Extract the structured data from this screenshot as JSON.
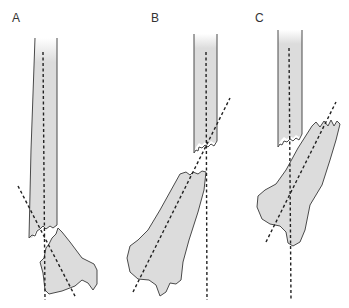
{
  "figure": {
    "panels": [
      {
        "label": "A",
        "description": "Distal radius fracture with transverse break; distal fragment nearly aligned"
      },
      {
        "label": "B",
        "description": "Distal fragment displaced and angulated relative to shaft"
      },
      {
        "label": "C",
        "description": "Distal fragment shortened and overlapping proximal shaft"
      }
    ],
    "colors": {
      "bone_fill": "#dcdcdc",
      "outline": "#4a4a4a",
      "axis_lines": "#222222",
      "background": "#ffffff"
    }
  }
}
